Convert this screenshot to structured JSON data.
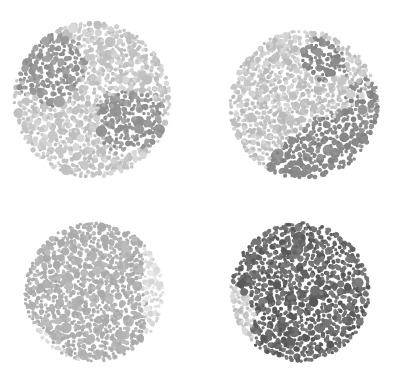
{
  "page": {
    "background_color": "#ffffff",
    "width": 398,
    "height": 392,
    "layout": "2x2-grid",
    "rendering": "grayscale"
  },
  "plates": [
    {
      "id": "plate-1",
      "position": "top-left",
      "label": "Ishihara Plate 1",
      "center_x": 92,
      "center_y": 100,
      "radius": 80,
      "seed": 1407,
      "dot_count": 1150,
      "dot_min_radius": 1.6,
      "dot_max_radius": 6.2,
      "contrast": "low",
      "figure_palette": [
        "#9a9a9a",
        "#8e8e8e",
        "#a4a4a4",
        "#949494"
      ],
      "ground_palette": [
        "#c8c8c8",
        "#d2d2d2",
        "#bebebe",
        "#d8d8d8",
        "#c2c2c2"
      ],
      "figure_shape": "blob-cluster",
      "figure_fraction": 0.3
    },
    {
      "id": "plate-2",
      "position": "top-right",
      "label": "Ishihara Plate 2",
      "center_x": 304,
      "center_y": 105,
      "radius": 76,
      "seed": 2281,
      "dot_count": 1100,
      "dot_min_radius": 1.6,
      "dot_max_radius": 6.0,
      "contrast": "medium",
      "figure_palette": [
        "#8c8c8c",
        "#828282",
        "#969696",
        "#888888"
      ],
      "ground_palette": [
        "#c6c6c6",
        "#d0d0d0",
        "#bababa",
        "#d6d6d6",
        "#c0c0c0"
      ],
      "figure_shape": "blob-cluster",
      "figure_fraction": 0.42
    },
    {
      "id": "plate-3",
      "position": "bottom-left",
      "label": "Ishihara Plate 3",
      "center_x": 94,
      "center_y": 292,
      "radius": 71,
      "seed": 3359,
      "dot_count": 1050,
      "dot_min_radius": 1.5,
      "dot_max_radius": 5.6,
      "contrast": "very-low",
      "figure_palette": [
        "#b4b4b4",
        "#aaaaaa",
        "#bcbcbc",
        "#b0b0b0"
      ],
      "ground_palette": [
        "#dcdcdc",
        "#e4e4e4",
        "#d4d4d4",
        "#eaeaea",
        "#d8d8d8"
      ],
      "figure_shape": "blob-cluster",
      "figure_fraction": 0.28
    },
    {
      "id": "plate-4",
      "position": "bottom-right",
      "label": "Ishihara Plate 4",
      "center_x": 300,
      "center_y": 292,
      "radius": 71,
      "seed": 4733,
      "dot_count": 1050,
      "dot_min_radius": 1.6,
      "dot_max_radius": 6.4,
      "contrast": "high",
      "figure_palette": [
        "#6f6f6f",
        "#626262",
        "#7c7c7c",
        "#585858",
        "#747474"
      ],
      "ground_palette": [
        "#cacaca",
        "#d4d4d4",
        "#bebebe",
        "#dadada",
        "#c4c4c4"
      ],
      "figure_shape": "blob-cluster",
      "figure_fraction": 0.52
    }
  ]
}
